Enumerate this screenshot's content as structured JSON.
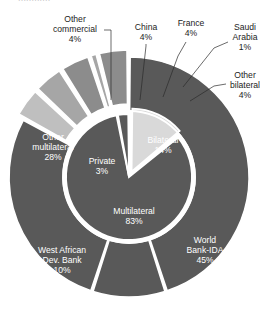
{
  "chart_data": {
    "type": "pie",
    "title": "",
    "subtitle": "",
    "xlabel": "",
    "ylabel": "",
    "legend_position": "none",
    "grid": false,
    "variant": "nested-donut",
    "units": "percent",
    "rings": [
      {
        "name": "inner",
        "categories": [
          "Multilateral",
          "Bilateral",
          "Private"
        ],
        "values": [
          83,
          14,
          3
        ],
        "labels": [
          "Multilateral\n83%",
          "Bilateral\n14%",
          "Private\n3%"
        ],
        "colors": [
          "#595959",
          "#d9d9d9",
          "#595959"
        ]
      },
      {
        "name": "outer",
        "categories": [
          "World Bank-IDA",
          "West African Dev. Bank",
          "Other multilateral",
          "Other commercial",
          "China",
          "France",
          "Saudi Arabia",
          "Other bilateral"
        ],
        "values": [
          45,
          10,
          28,
          4,
          4,
          4,
          1,
          4
        ],
        "colors": [
          "#595959",
          "#595959",
          "#595959",
          "#bfbfbf",
          "#a6a6a6",
          "#8c8c8c",
          "#a6a6a6",
          "#8c8c8c"
        ]
      }
    ],
    "labels": {
      "inner": [
        {
          "id": "multilateral",
          "line1": "Multilateral",
          "line2": "83%",
          "placement": "inside"
        },
        {
          "id": "bilateral",
          "line1": "Bilateral",
          "line2": "14%",
          "placement": "inside"
        },
        {
          "id": "private",
          "line1": "Private",
          "line2": "3%",
          "placement": "inside"
        }
      ],
      "outer": [
        {
          "id": "world-bank-ida",
          "line1": "World",
          "line2": "Bank-IDA",
          "line3": "45%",
          "placement": "inside"
        },
        {
          "id": "west-african-dev-bank",
          "line1": "West African",
          "line2": "Dev. Bank",
          "line3": "10%",
          "placement": "inside"
        },
        {
          "id": "other-multilateral",
          "line1": "Other",
          "line2": "multilateral",
          "line3": "28%",
          "placement": "inside"
        },
        {
          "id": "other-commercial",
          "line1": "Other",
          "line2": "commercial",
          "line3": "4%",
          "placement": "outside"
        },
        {
          "id": "china",
          "line1": "China",
          "line2": "4%",
          "placement": "outside"
        },
        {
          "id": "france",
          "line1": "France",
          "line2": "4%",
          "placement": "outside"
        },
        {
          "id": "saudi-arabia",
          "line1": "Saudi",
          "line2": "Arabia",
          "line3": "1%",
          "placement": "outside"
        },
        {
          "id": "other-bilateral",
          "line1": "Other",
          "line2": "bilateral",
          "line3": "4%",
          "placement": "outside"
        }
      ]
    },
    "colors": {
      "dark_gray": "#595959",
      "mid_gray": "#8c8c8c",
      "light_mid_gray": "#a6a6a6",
      "light_gray": "#bfbfbf",
      "pale_gray": "#d9d9d9",
      "separator": "#ffffff",
      "label_text": "#1c1c1c",
      "inside_label_text": "#ffffff",
      "background": "#ffffff"
    }
  },
  "title_ghost": "............"
}
